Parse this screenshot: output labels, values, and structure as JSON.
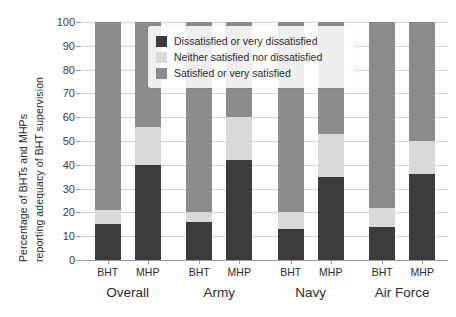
{
  "chart_data": {
    "type": "bar",
    "subtype": "stacked-bar-grouped",
    "title": "",
    "xlabel": "",
    "ylabel": "Percentage of BHTs and MHPs reporting adequacy of BHT supervision",
    "ylabel_lines": [
      "Percentage of BHTs and MHPs",
      "reporting adequacy of BHT supervision"
    ],
    "ylim": [
      0,
      100
    ],
    "yticks": [
      0,
      10,
      20,
      30,
      40,
      50,
      60,
      70,
      80,
      90,
      100
    ],
    "ytick_labels": [
      "0",
      "10",
      "20",
      "30",
      "40",
      "50",
      "60",
      "70",
      "80",
      "90",
      "100"
    ],
    "grid": true,
    "grid_axis": "y",
    "legend_position": "upper center",
    "stack_order_bottom_to_top": [
      "Dissatisfied or very dissatisfied",
      "Neither satisfied nor dissatisfied",
      "Satisfied or very satisfied"
    ],
    "series": [
      {
        "name": "Dissatisfied or very dissatisfied",
        "color": "#3c3c3c",
        "values": [
          15,
          40,
          16,
          42,
          13,
          35,
          14,
          36
        ]
      },
      {
        "name": "Neither satisfied nor dissatisfied",
        "color": "#d9d9d9",
        "values": [
          6,
          16,
          4,
          18,
          7,
          18,
          8,
          14
        ]
      },
      {
        "name": "Satisfied or very satisfied",
        "color": "#8c8c8c",
        "values": [
          79,
          44,
          80,
          40,
          80,
          47,
          78,
          50
        ]
      }
    ],
    "categories": [
      "Overall BHT",
      "Overall MHP",
      "Army BHT",
      "Army MHP",
      "Navy BHT",
      "Navy MHP",
      "Air Force BHT",
      "Air Force MHP"
    ],
    "groups": [
      {
        "label": "Overall",
        "bars": [
          {
            "tick": "BHT",
            "segments": [
              15,
              6,
              79
            ]
          },
          {
            "tick": "MHP",
            "segments": [
              40,
              16,
              44
            ]
          }
        ]
      },
      {
        "label": "Army",
        "bars": [
          {
            "tick": "BHT",
            "segments": [
              16,
              4,
              80
            ]
          },
          {
            "tick": "MHP",
            "segments": [
              42,
              18,
              40
            ]
          }
        ]
      },
      {
        "label": "Navy",
        "bars": [
          {
            "tick": "BHT",
            "segments": [
              13,
              7,
              80
            ]
          },
          {
            "tick": "MHP",
            "segments": [
              35,
              18,
              47
            ]
          }
        ]
      },
      {
        "label": "Air Force",
        "bars": [
          {
            "tick": "BHT",
            "segments": [
              14,
              8,
              78
            ]
          },
          {
            "tick": "MHP",
            "segments": [
              36,
              14,
              50
            ]
          }
        ]
      }
    ]
  },
  "legend": {
    "items": [
      {
        "label": "Dissatisfied or very dissatisfied",
        "color": "#3c3c3c"
      },
      {
        "label": "Neither satisfied nor dissatisfied",
        "color": "#d9d9d9"
      },
      {
        "label": "Satisfied or very satisfied",
        "color": "#8c8c8c"
      }
    ]
  },
  "colors": {
    "dissatisfied": "#3c3c3c",
    "neither": "#d9d9d9",
    "satisfied": "#8c8c8c",
    "grid": "#d5d5d5",
    "axis": "#9a9a9a",
    "text": "#2b2b2b",
    "background": "#ffffff"
  }
}
